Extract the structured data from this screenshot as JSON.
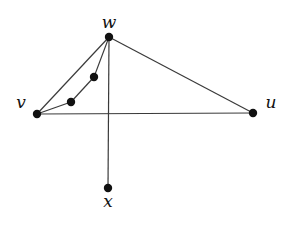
{
  "diagram": {
    "type": "graph",
    "nodes": [
      {
        "id": "w",
        "label": "w",
        "x": 109,
        "y": 37,
        "label_x": 109,
        "label_y": 28,
        "anchor": "middle"
      },
      {
        "id": "v",
        "label": "v",
        "x": 37,
        "y": 114,
        "label_x": 21,
        "label_y": 108,
        "anchor": "middle"
      },
      {
        "id": "u",
        "label": "u",
        "x": 253,
        "y": 113,
        "label_x": 271,
        "label_y": 108,
        "anchor": "middle"
      },
      {
        "id": "x",
        "label": "x",
        "x": 108,
        "y": 188,
        "label_x": 108,
        "label_y": 207,
        "anchor": "middle"
      },
      {
        "id": "p1",
        "label": "",
        "x": 94,
        "y": 77
      },
      {
        "id": "p2",
        "label": "",
        "x": 71,
        "y": 102
      }
    ],
    "edges": [
      {
        "from": "w",
        "to": "v"
      },
      {
        "from": "w",
        "to": "u"
      },
      {
        "from": "v",
        "to": "u"
      },
      {
        "from": "w",
        "to": "x"
      },
      {
        "from": "w",
        "to": "p1"
      },
      {
        "from": "p1",
        "to": "p2"
      },
      {
        "from": "p2",
        "to": "v"
      }
    ],
    "colors": {
      "edge": "#3a3a3a",
      "node": "#111111",
      "background": "#ffffff"
    }
  }
}
